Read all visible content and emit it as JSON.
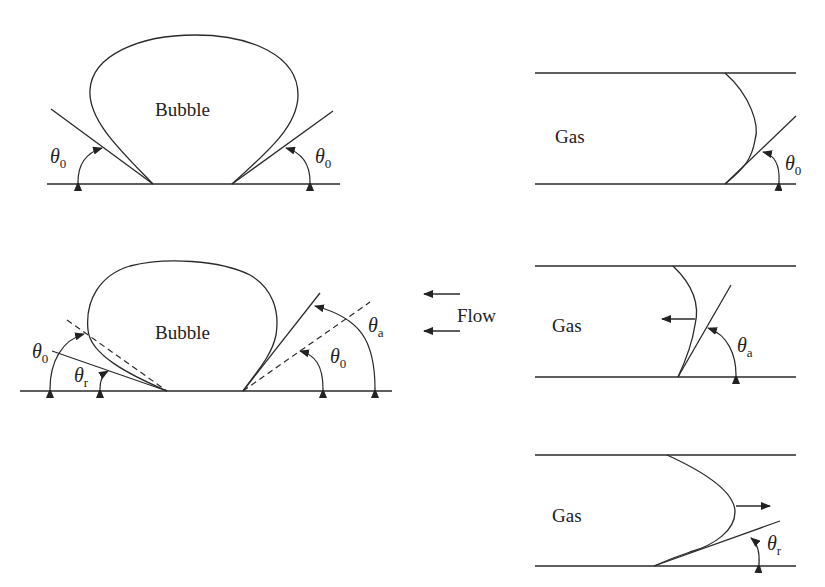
{
  "panels": {
    "bubble_static": {
      "label": "Bubble",
      "angle_left": {
        "symbol": "θ",
        "sub": "0"
      },
      "angle_right": {
        "symbol": "θ",
        "sub": "0"
      }
    },
    "gas_static": {
      "label": "Gas",
      "angle": {
        "symbol": "θ",
        "sub": "0"
      }
    },
    "bubble_flow": {
      "label": "Bubble",
      "angle_left_outer": {
        "symbol": "θ",
        "sub": "0"
      },
      "angle_left_inner": {
        "symbol": "θ",
        "sub": "r"
      },
      "angle_right_outer": {
        "symbol": "θ",
        "sub": "a"
      },
      "angle_right_inner": {
        "symbol": "θ",
        "sub": "0"
      }
    },
    "flow": {
      "label": "Flow",
      "direction": "left"
    },
    "gas_advancing": {
      "label": "Gas",
      "angle": {
        "symbol": "θ",
        "sub": "a"
      },
      "motion": "left"
    },
    "gas_receding": {
      "label": "Gas",
      "angle": {
        "symbol": "θ",
        "sub": "r"
      },
      "motion": "right"
    }
  }
}
